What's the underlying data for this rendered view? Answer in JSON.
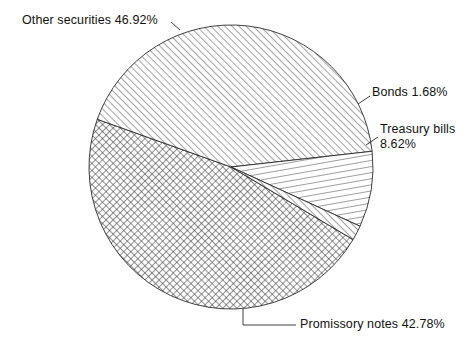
{
  "chart_data": {
    "type": "pie",
    "title": "",
    "xlabel": "",
    "ylabel": "",
    "units": "percent",
    "legend_position": "none",
    "grid": false,
    "categories": [
      "Other securities",
      "Promissory notes",
      "Treasury bills",
      "Bonds"
    ],
    "values": [
      46.92,
      42.78,
      8.62,
      1.68
    ],
    "slices": [
      {
        "name": "other-securities",
        "label": "Other securities",
        "value": 46.92,
        "value_text": "46.92%",
        "label_text": "Other securities 46.92%",
        "pattern": "cross-hatch",
        "start_angle_deg": 160.36,
        "sweep_deg": 168.91
      },
      {
        "name": "promissory-notes",
        "label": "Promissory notes",
        "value": 42.78,
        "value_text": "42.78%",
        "label_text": "Promissory notes 42.78%",
        "pattern": "diagonal-hatch",
        "start_angle_deg": 6.36,
        "sweep_deg": 154.01
      },
      {
        "name": "treasury-bills",
        "label": "Treasury bills",
        "value": 8.62,
        "value_text": "8.62%",
        "label_line1": "Treasury bills",
        "label_line2": "8.62%",
        "pattern": "horizontal-hatch",
        "start_angle_deg": -24.67,
        "sweep_deg": 31.03
      },
      {
        "name": "bonds",
        "label": "Bonds",
        "value": 1.68,
        "value_text": "1.68%",
        "label_text": "Bonds 1.68%",
        "pattern": "diagonal-hatch-fine",
        "start_angle_deg": -30.72,
        "sweep_deg": 6.05
      }
    ],
    "geometry": {
      "center_x": 231,
      "center_y": 167,
      "radius": 142
    },
    "colors": {
      "outline": "#2b2b2b",
      "hatch": "#2b2b2b",
      "background": "#ffffff",
      "text": "#121212"
    }
  },
  "labels": {
    "other_securities": "Other securities 46.92%",
    "bonds": "Bonds 1.68%",
    "treasury_bills_line1": "Treasury bills",
    "treasury_bills_line2": "8.62%",
    "promissory_notes": "Promissory notes 42.78%"
  }
}
